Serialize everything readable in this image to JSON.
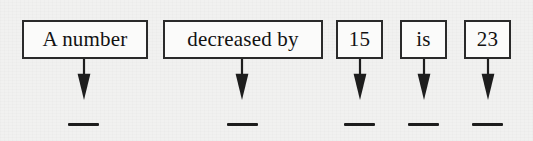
{
  "worksheet": {
    "type": "sentence-translation-diagram",
    "description": "Word phrase broken into boxed parts with arrows pointing to blank answer lines",
    "sentence": "A number decreased by 15 is 23",
    "answer_blank_label": "___",
    "terms": [
      {
        "id": "term-a-number",
        "label": "A number",
        "box": {
          "x": 22,
          "y": 20,
          "w": 126,
          "h": 39
        },
        "arrow_x": 84,
        "blank": {
          "x": 68,
          "y": 123,
          "w": 31
        }
      },
      {
        "id": "term-decreased-by",
        "label": "decreased by",
        "box": {
          "x": 163,
          "y": 20,
          "w": 160,
          "h": 39
        },
        "arrow_x": 242,
        "blank": {
          "x": 227,
          "y": 123,
          "w": 31
        }
      },
      {
        "id": "term-15",
        "label": "15",
        "box": {
          "x": 336,
          "y": 20,
          "w": 47,
          "h": 39
        },
        "arrow_x": 360,
        "blank": {
          "x": 344,
          "y": 123,
          "w": 31
        }
      },
      {
        "id": "term-is",
        "label": "is",
        "box": {
          "x": 400,
          "y": 20,
          "w": 47,
          "h": 39
        },
        "arrow_x": 424,
        "blank": {
          "x": 408,
          "y": 123,
          "w": 31
        }
      },
      {
        "id": "term-23",
        "label": "23",
        "box": {
          "x": 464,
          "y": 20,
          "w": 47,
          "h": 39
        },
        "arrow_x": 488,
        "blank": {
          "x": 472,
          "y": 123,
          "w": 31
        }
      }
    ],
    "colors": {
      "background": "#f1f1f0",
      "box_fill": "#fbfbfa",
      "box_border": "#2a2a2a",
      "ink": "#121212",
      "arrow": "#1d1d1d",
      "blank_line": "#1d1d1d"
    },
    "arrow_geometry": {
      "top": 59,
      "tip": 100,
      "head_width": 13,
      "head_height": 26,
      "shaft_width": 2
    }
  }
}
